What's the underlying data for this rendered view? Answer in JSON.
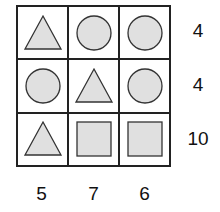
{
  "puzzle": {
    "grid": [
      [
        "triangle",
        "circle",
        "circle"
      ],
      [
        "circle",
        "triangle",
        "circle"
      ],
      [
        "triangle",
        "square",
        "square"
      ]
    ],
    "row_sums": [
      "4",
      "4",
      "10"
    ],
    "col_sums": [
      "5",
      "7",
      "6"
    ],
    "colors": {
      "fill": "#e0e0e0",
      "stroke": "#333333",
      "grid": "#222222"
    }
  }
}
